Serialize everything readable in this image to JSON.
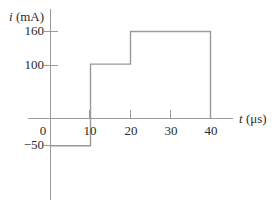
{
  "chart_data": {
    "type": "line",
    "title": "",
    "subtitle": "",
    "xlabel": "t (μs)",
    "ylabel": "i (mA)",
    "xlabel_symbol": "t",
    "xlabel_unit": "(μs)",
    "ylabel_symbol": "i",
    "ylabel_unit": "(mA)",
    "grid": false,
    "legend": false,
    "legend_position": "none",
    "xlim": [
      -5,
      48
    ],
    "ylim": [
      -120,
      200
    ],
    "xticks": [
      0,
      10,
      20,
      30,
      40
    ],
    "xtick_labels": [
      "0",
      "10",
      "20",
      "30",
      "40"
    ],
    "yticks": [
      -50,
      100,
      160
    ],
    "ytick_labels": [
      "−50",
      "100",
      "160"
    ],
    "line_color": "#9a9a9a",
    "axis_color": "#9a9a9a",
    "text_color": "#2b2b2b",
    "steps": [
      {
        "t_start": 0,
        "t_end": 10,
        "value": -50
      },
      {
        "t_start": 10,
        "t_end": 20,
        "value": 100
      },
      {
        "t_start": 20,
        "t_end": 40,
        "value": 160
      },
      {
        "t_start": 40,
        "t_end": 40,
        "value": 0
      }
    ],
    "x": [
      0,
      10,
      10,
      20,
      20,
      40,
      40
    ],
    "y": [
      -50,
      -50,
      100,
      100,
      160,
      160,
      0
    ]
  },
  "labels": {
    "y_axis_title": "i (mA)",
    "y_axis_title_symbol": "i",
    "y_axis_title_unit": "(mA)",
    "x_axis_title": "t (μs)",
    "x_axis_title_symbol": "t",
    "x_axis_title_unit": "(μs)",
    "ytick_160": "160",
    "ytick_100": "100",
    "ytick_neg50": "−50",
    "xtick_0": "0",
    "xtick_10": "10",
    "xtick_20": "20",
    "xtick_30": "30",
    "xtick_40": "40"
  }
}
